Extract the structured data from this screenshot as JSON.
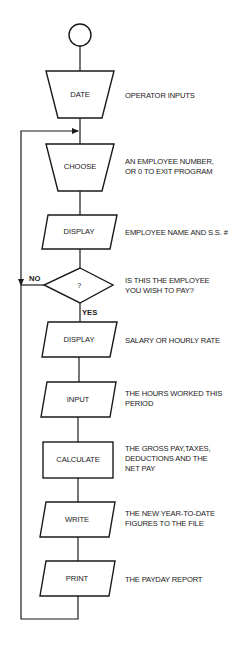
{
  "diagram": {
    "start": {
      "label": ""
    },
    "steps": [
      {
        "id": "date",
        "shape": "manual-input",
        "label": "DATE",
        "description": [
          "OPERATOR INPUTS"
        ]
      },
      {
        "id": "choose",
        "shape": "manual-input",
        "label": "CHOOSE",
        "description": [
          "AN EMPLOYEE NUMBER,",
          "OR 0 TO EXIT PROGRAM"
        ]
      },
      {
        "id": "display-name",
        "shape": "io",
        "label": "DISPLAY",
        "description": [
          "EMPLOYEE NAME AND S.S. #"
        ]
      },
      {
        "id": "decision",
        "shape": "decision",
        "label": "?",
        "description": [
          "IS THIS THE EMPLOYEE",
          "YOU WISH TO PAY?"
        ]
      },
      {
        "id": "display-rate",
        "shape": "io",
        "label": "DISPLAY",
        "description": [
          "SALARY OR HOURLY RATE"
        ]
      },
      {
        "id": "input-hours",
        "shape": "io",
        "label": "INPUT",
        "description": [
          "THE HOURS WORKED THIS",
          "PERIOD"
        ]
      },
      {
        "id": "calculate",
        "shape": "process",
        "label": "CALCULATE",
        "description": [
          "THE GROSS PAY,TAXES,",
          "DEDUCTIONS AND THE",
          "NET PAY"
        ]
      },
      {
        "id": "write",
        "shape": "io",
        "label": "WRITE",
        "description": [
          "THE NEW YEAR-TO-DATE",
          "FIGURES TO THE FILE"
        ]
      },
      {
        "id": "print",
        "shape": "io",
        "label": "PRINT",
        "description": [
          "THE PAYDAY REPORT"
        ]
      }
    ],
    "branches": {
      "no": "NO",
      "yes": "YES"
    },
    "colors": {
      "stroke": "#1a1a1a",
      "background": "#ffffff"
    }
  }
}
